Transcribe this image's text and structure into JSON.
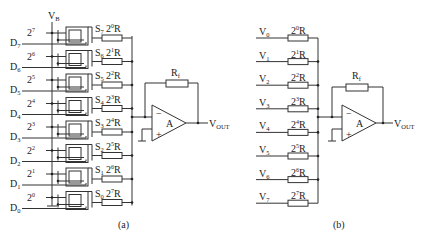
{
  "figure_a": {
    "caption": "(a)",
    "supply_label": "V",
    "supply_sub": "B",
    "rows": [
      {
        "weight_base": "2",
        "weight_exp": "7",
        "switch": "S",
        "switch_sub": "7",
        "res_base": "2",
        "res_exp": "0",
        "res_unit": "R",
        "data_label": "D",
        "data_sub": "7"
      },
      {
        "weight_base": "2",
        "weight_exp": "6",
        "switch": "S",
        "switch_sub": "6",
        "res_base": "2",
        "res_exp": "1",
        "res_unit": "R",
        "data_label": "D",
        "data_sub": "6"
      },
      {
        "weight_base": "2",
        "weight_exp": "5",
        "switch": "S",
        "switch_sub": "5",
        "res_base": "2",
        "res_exp": "2",
        "res_unit": "R",
        "data_label": "D",
        "data_sub": "5"
      },
      {
        "weight_base": "2",
        "weight_exp": "4",
        "switch": "S",
        "switch_sub": "4",
        "res_base": "2",
        "res_exp": "3",
        "res_unit": "R",
        "data_label": "D",
        "data_sub": "4"
      },
      {
        "weight_base": "2",
        "weight_exp": "3",
        "switch": "S",
        "switch_sub": "3",
        "res_base": "2",
        "res_exp": "4",
        "res_unit": "R",
        "data_label": "D",
        "data_sub": "3"
      },
      {
        "weight_base": "2",
        "weight_exp": "2",
        "switch": "S",
        "switch_sub": "2",
        "res_base": "2",
        "res_exp": "5",
        "res_unit": "R",
        "data_label": "D",
        "data_sub": "2"
      },
      {
        "weight_base": "2",
        "weight_exp": "1",
        "switch": "S",
        "switch_sub": "1",
        "res_base": "2",
        "res_exp": "6",
        "res_unit": "R",
        "data_label": "D",
        "data_sub": "1"
      },
      {
        "weight_base": "2",
        "weight_exp": "0",
        "switch": "S",
        "switch_sub": "0",
        "res_base": "2",
        "res_exp": "7",
        "res_unit": "R",
        "data_label": "D",
        "data_sub": "0"
      }
    ],
    "feedback_label": "R",
    "feedback_sub": "f",
    "opamp_label": "A",
    "inv_sign": "−",
    "noninv_sign": "+",
    "output_label": "V",
    "output_sub": "OUT"
  },
  "figure_b": {
    "caption": "(b)",
    "rows": [
      {
        "in_label": "V",
        "in_sub": "0",
        "res_base": "2",
        "res_exp": "0",
        "res_unit": "R"
      },
      {
        "in_label": "V",
        "in_sub": "1",
        "res_base": "2",
        "res_exp": "1",
        "res_unit": "R"
      },
      {
        "in_label": "V",
        "in_sub": "2",
        "res_base": "2",
        "res_exp": "2",
        "res_unit": "R"
      },
      {
        "in_label": "V",
        "in_sub": "3",
        "res_base": "2",
        "res_exp": "3",
        "res_unit": "R"
      },
      {
        "in_label": "V",
        "in_sub": "4",
        "res_base": "2",
        "res_exp": "4",
        "res_unit": "R"
      },
      {
        "in_label": "V",
        "in_sub": "5",
        "res_base": "2",
        "res_exp": "5",
        "res_unit": "R"
      },
      {
        "in_label": "V",
        "in_sub": "6",
        "res_base": "2",
        "res_exp": "6",
        "res_unit": "R"
      },
      {
        "in_label": "V",
        "in_sub": "7",
        "res_base": "2",
        "res_exp": "7",
        "res_unit": "R"
      }
    ],
    "feedback_label": "R",
    "feedback_sub": "f",
    "opamp_label": "A",
    "inv_sign": "−",
    "noninv_sign": "+",
    "output_label": "V",
    "output_sub": "OUT"
  }
}
